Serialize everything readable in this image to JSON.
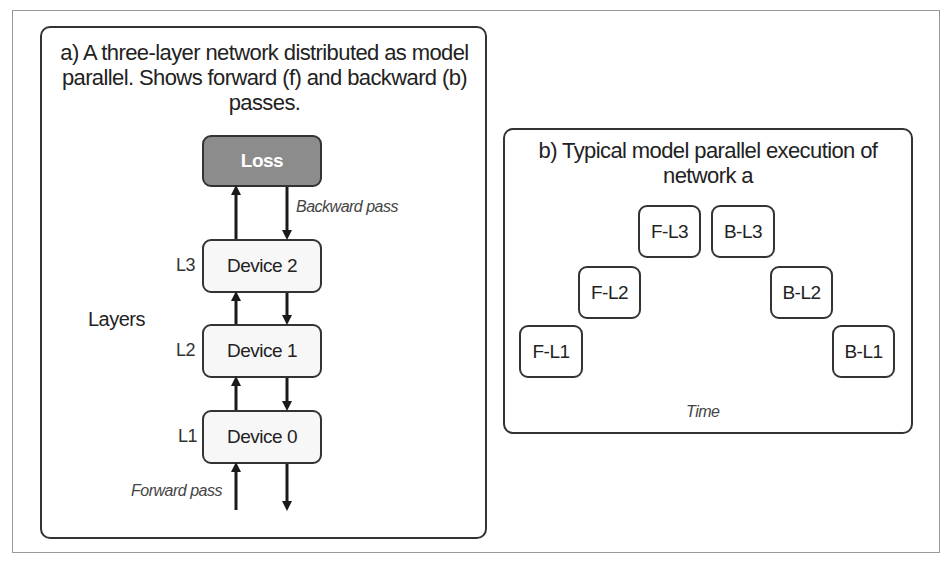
{
  "panel_a": {
    "title": "a) A three-layer network distributed as model parallel. Shows forward (f) and backward (b) passes.",
    "title_lines": [
      "a) A three-layer network distributed as model",
      "parallel. Shows forward (f) and backward (b)",
      "passes."
    ],
    "loss_label": "Loss",
    "backward_label": "Backward pass",
    "forward_label": "Forward pass",
    "layers_label": "Layers",
    "devices": [
      {
        "layer": "L3",
        "name": "Device 2"
      },
      {
        "layer": "L2",
        "name": "Device 1"
      },
      {
        "layer": "L1",
        "name": "Device 0"
      }
    ]
  },
  "panel_b": {
    "title_lines": [
      "b) Typical model parallel execution of",
      "network a"
    ],
    "steps": [
      "F-L1",
      "F-L2",
      "F-L3",
      "B-L3",
      "B-L2",
      "B-L1"
    ],
    "axis_label": "Time"
  },
  "colors": {
    "loss_fill": "#8c8c8c",
    "box_fill": "#f7f7f7",
    "stroke": "#333333"
  }
}
